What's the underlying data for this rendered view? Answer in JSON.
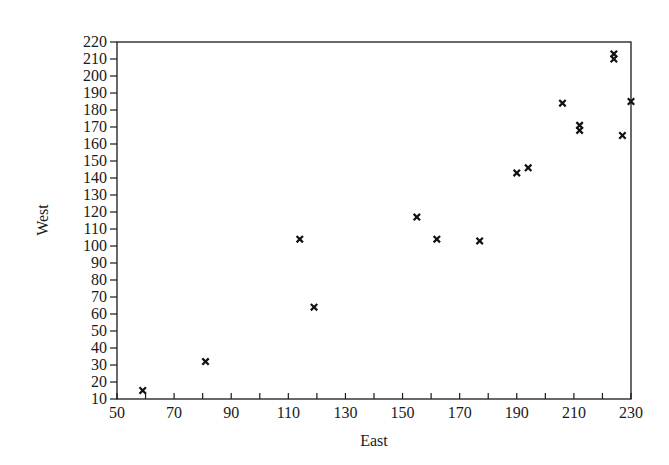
{
  "chart_data": {
    "type": "scatter",
    "title": "",
    "xlabel": "East",
    "ylabel": "West",
    "xlim": [
      50,
      230
    ],
    "ylim": [
      10,
      220
    ],
    "x_ticks_major": [
      50,
      70,
      90,
      110,
      130,
      150,
      170,
      190,
      210,
      230
    ],
    "x_ticks_minor_step": 10,
    "y_ticks": [
      10,
      20,
      30,
      40,
      50,
      60,
      70,
      80,
      90,
      100,
      110,
      120,
      130,
      140,
      150,
      160,
      170,
      180,
      190,
      200,
      210,
      220
    ],
    "grid": false,
    "legend": null,
    "marker": "x",
    "series": [
      {
        "name": "West vs East",
        "points": [
          {
            "x": 59,
            "y": 15
          },
          {
            "x": 81,
            "y": 32
          },
          {
            "x": 114,
            "y": 104
          },
          {
            "x": 119,
            "y": 64
          },
          {
            "x": 155,
            "y": 117
          },
          {
            "x": 162,
            "y": 104
          },
          {
            "x": 177,
            "y": 103
          },
          {
            "x": 190,
            "y": 143
          },
          {
            "x": 194,
            "y": 146
          },
          {
            "x": 206,
            "y": 184
          },
          {
            "x": 212,
            "y": 171
          },
          {
            "x": 212,
            "y": 168
          },
          {
            "x": 224,
            "y": 213
          },
          {
            "x": 224,
            "y": 210
          },
          {
            "x": 227,
            "y": 165
          },
          {
            "x": 230,
            "y": 185
          }
        ]
      }
    ]
  },
  "colors": {
    "axis": "#1a1a1a",
    "marker": "#111111",
    "background": "#ffffff"
  }
}
